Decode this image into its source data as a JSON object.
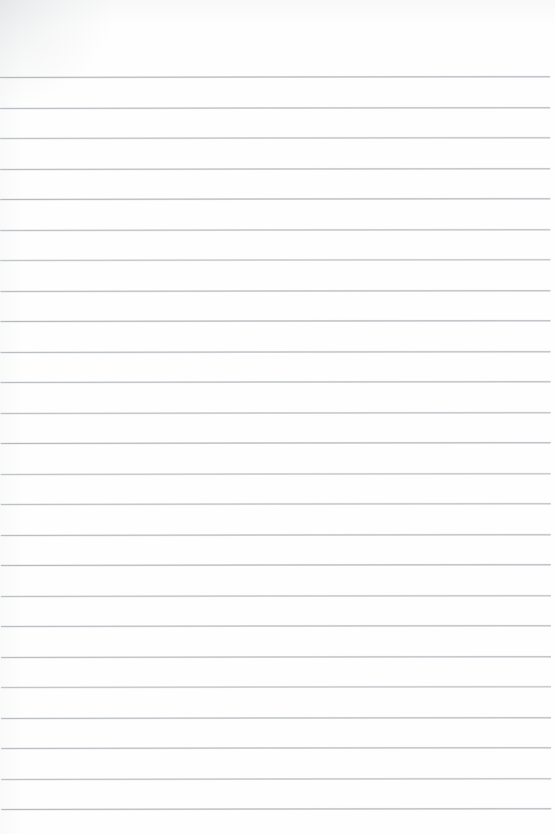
{
  "document": {
    "kind": "scanned-ruled-paper",
    "description": "Blank lined notebook page, no handwriting or printed text",
    "page_width": 555,
    "page_height": 834,
    "background_color": "#fefefe",
    "content_text": "",
    "has_header": false,
    "has_margin_rule": false,
    "has_page_number": false,
    "has_punch_holes": false
  },
  "ruling": {
    "line_color": "#b9bdc1",
    "line_thickness_px": 1,
    "line_count": 25,
    "first_line_y": 77,
    "line_spacing_px": 30.5,
    "last_line_y": 809,
    "line_start_x": 0,
    "line_end_x": 550,
    "top_margin_px": 77,
    "bottom_margin_px": 25,
    "right_margin_px": 5,
    "skew_degrees": -0.085,
    "line_y_positions": [
      77,
      107.5,
      138,
      168.5,
      199,
      229.5,
      260,
      290.5,
      321,
      351.5,
      382,
      412.5,
      443,
      473.5,
      504,
      534.5,
      565,
      595.5,
      626,
      656.5,
      687,
      717.5,
      748,
      778.5,
      809
    ]
  },
  "scan_artifacts": {
    "corner_shadow": "top-left",
    "shadow_color": "#a8acb1",
    "paper_tone": "#fefefe"
  }
}
